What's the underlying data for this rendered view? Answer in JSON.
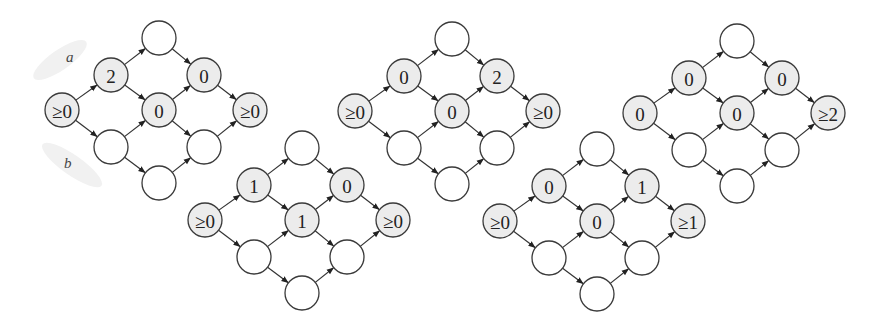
{
  "figure": {
    "side_labels": [
      {
        "text": "a",
        "x": 66,
        "y": 62
      },
      {
        "text": "b",
        "x": 64,
        "y": 168
      }
    ],
    "colors": {
      "labeled_fill": "#ececec",
      "empty_fill": "#ffffff",
      "stroke": "#3a3a3a"
    },
    "node_radius": 17,
    "layout": {
      "description": "Each graph is a diamond lattice: source S, two mid-left nodes (upper U1, lower L1), top T, center C, bottom B, two mid-right nodes (upper U2, lower L2), and sink E.",
      "relative_positions": {
        "S": [
          0,
          0
        ],
        "U1": [
          49,
          -35
        ],
        "L1": [
          49,
          37
        ],
        "T": [
          97,
          -72
        ],
        "C": [
          97,
          0
        ],
        "B": [
          97,
          73
        ],
        "U2": [
          142,
          -35
        ],
        "L2": [
          142,
          37
        ],
        "E": [
          188,
          0
        ]
      },
      "edges": [
        [
          "S",
          "U1"
        ],
        [
          "S",
          "L1"
        ],
        [
          "U1",
          "T"
        ],
        [
          "U1",
          "C"
        ],
        [
          "L1",
          "C"
        ],
        [
          "L1",
          "B"
        ],
        [
          "T",
          "U2"
        ],
        [
          "C",
          "U2"
        ],
        [
          "C",
          "L2"
        ],
        [
          "B",
          "L2"
        ],
        [
          "U2",
          "E"
        ],
        [
          "L2",
          "E"
        ]
      ]
    },
    "graphs": [
      {
        "id": "g1",
        "origin": [
          62,
          110
        ],
        "labels": {
          "S": "≥0",
          "U1": "2",
          "T": "",
          "C": "0",
          "U2": "0",
          "E": "≥0",
          "L1": "",
          "B": "",
          "L2": ""
        }
      },
      {
        "id": "g2",
        "origin": [
          205,
          220
        ],
        "labels": {
          "S": "≥0",
          "U1": "1",
          "T": "",
          "C": "1",
          "U2": "0",
          "E": "≥0",
          "L1": "",
          "B": "",
          "L2": ""
        }
      },
      {
        "id": "g3",
        "origin": [
          355,
          111
        ],
        "labels": {
          "S": "≥0",
          "U1": "0",
          "T": "",
          "C": "0",
          "U2": "2",
          "E": "≥0",
          "L1": "",
          "B": "",
          "L2": ""
        }
      },
      {
        "id": "g4",
        "origin": [
          500,
          221
        ],
        "labels": {
          "S": "≥0",
          "U1": "0",
          "T": "",
          "C": "0",
          "U2": "1",
          "E": "≥1",
          "L1": "",
          "B": "",
          "L2": ""
        }
      },
      {
        "id": "g5",
        "origin": [
          640,
          113
        ],
        "labels": {
          "S": "0",
          "U1": "0",
          "T": "",
          "C": "0",
          "U2": "0",
          "E": "≥2",
          "L1": "",
          "B": "",
          "L2": ""
        }
      }
    ]
  }
}
